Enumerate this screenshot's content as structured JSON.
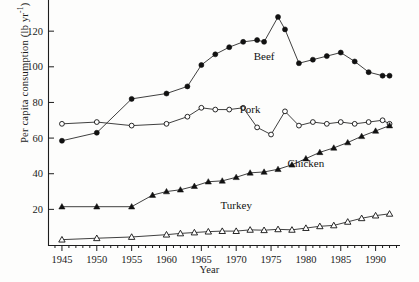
{
  "figure": {
    "title": "",
    "ylabel_text": "Per capita consumption (lb yr",
    "ylabel_exponent": "-1",
    "ylabel_close": ")",
    "xlabel": "Year"
  },
  "axes": {
    "y_ticks": [
      "20",
      "40",
      "60",
      "80",
      "100",
      "120"
    ],
    "x_ticks": [
      "1945",
      "1950",
      "1955",
      "1960",
      "1965",
      "1970",
      "1975",
      "1980",
      "1985",
      "1990"
    ]
  },
  "series_labels": {
    "beef": "Beef",
    "pork": "Pork",
    "chicken": "Chicken",
    "turkey": "Turkey"
  },
  "chart_data": {
    "type": "line",
    "title": "",
    "xlabel": "Year",
    "ylabel": "Per capita consumption (lb yr-1)",
    "xlim": [
      1943,
      1993.5
    ],
    "ylim": [
      0,
      133
    ],
    "ytick_values": [
      20,
      40,
      60,
      80,
      100,
      120
    ],
    "xtick_values": [
      1945,
      1950,
      1955,
      1960,
      1965,
      1970,
      1975,
      1980,
      1985,
      1990
    ],
    "grid": false,
    "legend": "inline-annotations",
    "series": [
      {
        "name": "Beef",
        "marker": "filled-circle",
        "label_position": [
          1974,
          104
        ],
        "x": [
          1945,
          1950,
          1955,
          1960,
          1963,
          1965,
          1967,
          1969,
          1971,
          1973,
          1974,
          1976,
          1977,
          1979,
          1981,
          1983,
          1985,
          1987,
          1989,
          1991,
          1992
        ],
        "y": [
          58.5,
          63,
          82,
          85,
          89,
          101,
          107,
          111,
          114,
          115,
          114,
          128,
          121,
          102,
          104,
          106,
          108,
          103,
          97,
          95,
          95
        ]
      },
      {
        "name": "Pork",
        "marker": "open-circle",
        "label_position": [
          1972,
          74
        ],
        "x": [
          1945,
          1950,
          1955,
          1960,
          1963,
          1965,
          1967,
          1969,
          1971,
          1973,
          1975,
          1977,
          1979,
          1981,
          1983,
          1985,
          1987,
          1989,
          1991,
          1992
        ],
        "y": [
          68,
          69,
          67,
          68,
          72,
          77,
          76,
          76,
          77,
          66,
          62,
          75,
          67,
          69,
          68,
          69,
          68,
          69,
          70,
          68
        ]
      },
      {
        "name": "Chicken",
        "marker": "filled-triangle",
        "label_position": [
          1980,
          44
        ],
        "x": [
          1945,
          1950,
          1955,
          1958,
          1960,
          1962,
          1964,
          1966,
          1968,
          1970,
          1972,
          1974,
          1976,
          1978,
          1980,
          1982,
          1984,
          1986,
          1988,
          1990,
          1992
        ],
        "y": [
          21.5,
          21.5,
          21.5,
          28,
          30,
          31,
          33,
          35.5,
          36,
          38,
          40.5,
          41,
          42.5,
          45,
          48.5,
          52,
          54.5,
          57.5,
          61,
          64,
          67
        ]
      },
      {
        "name": "Turkey",
        "marker": "open-triangle",
        "label_position": [
          1970,
          20
        ],
        "x": [
          1945,
          1950,
          1955,
          1960,
          1962,
          1964,
          1966,
          1968,
          1970,
          1972,
          1974,
          1976,
          1978,
          1980,
          1982,
          1984,
          1986,
          1988,
          1990,
          1992
        ],
        "y": [
          3,
          3.8,
          4.5,
          5.8,
          6.5,
          7,
          7.5,
          7.8,
          7.8,
          8.5,
          8.3,
          8.8,
          8.5,
          9.5,
          10.5,
          11,
          13,
          15,
          16.5,
          17.5
        ]
      }
    ]
  }
}
